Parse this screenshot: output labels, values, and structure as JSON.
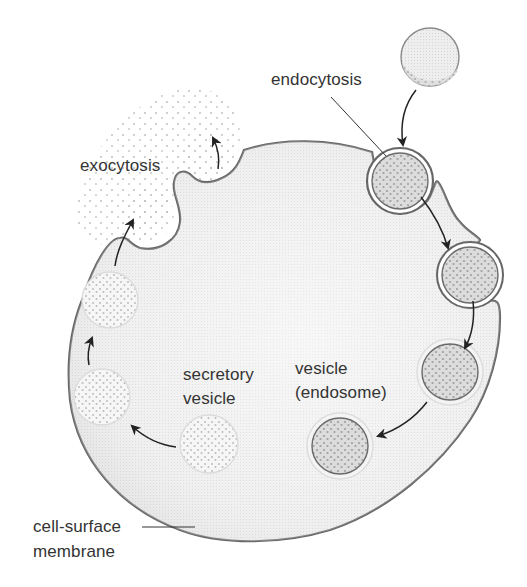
{
  "diagram": {
    "labels": {
      "endocytosis": "endocytosis",
      "exocytosis": "exocytosis",
      "secretory_vesicle_line1": "secretory",
      "secretory_vesicle_line2": "vesicle",
      "endosome_line1": "vesicle",
      "endosome_line2": "(endosome)",
      "membrane_line1": "cell-surface",
      "membrane_line2": "membrane"
    },
    "colors": {
      "membrane": "#6a6a6a",
      "cytoplasm": "#ececec",
      "vesicle_fill_dark": "#d4d4d4",
      "vesicle_fill_light": "#f1f1f1",
      "dots": "#a9a9a9",
      "arrow": "#222222",
      "text": "#333333"
    },
    "nodes": [
      {
        "id": "extracellular-particle",
        "label": "material outside cell"
      },
      {
        "id": "endocytic-vesicle",
        "label": "endocytosis"
      },
      {
        "id": "internalized-vesicle",
        "label": "vesicle"
      },
      {
        "id": "endosome-1",
        "label": "vesicle (endosome)"
      },
      {
        "id": "endosome-2",
        "label": "vesicle (endosome)"
      },
      {
        "id": "secretory-vesicle",
        "label": "secretory vesicle"
      },
      {
        "id": "secretory-vesicle-2",
        "label": "secretory vesicle"
      },
      {
        "id": "secretory-vesicle-3",
        "label": "secretory vesicle"
      },
      {
        "id": "exocytosis-release",
        "label": "exocytosis"
      }
    ],
    "edges": [
      {
        "from": "extracellular-particle",
        "to": "endocytic-vesicle"
      },
      {
        "from": "endocytic-vesicle",
        "to": "internalized-vesicle"
      },
      {
        "from": "internalized-vesicle",
        "to": "endosome-1"
      },
      {
        "from": "endosome-1",
        "to": "endosome-2"
      },
      {
        "from": "secretory-vesicle",
        "to": "secretory-vesicle-2"
      },
      {
        "from": "secretory-vesicle-2",
        "to": "secretory-vesicle-3"
      },
      {
        "from": "secretory-vesicle-3",
        "to": "exocytosis-release"
      }
    ]
  }
}
